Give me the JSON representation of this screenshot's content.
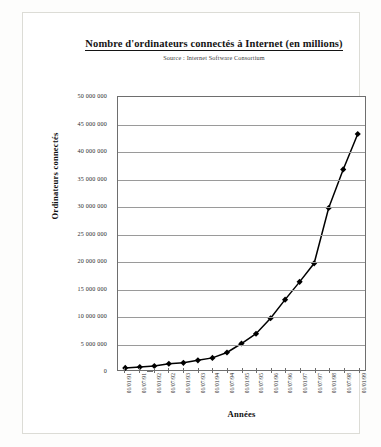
{
  "chart_title": "Nombre d'ordinateurs connectés à Internet (en millions)",
  "chart_subtitle": "Source : Internet Software Consortium",
  "axis": {
    "y_title": "Ordinateurs connectés",
    "x_title": "Années"
  },
  "chart_data": {
    "type": "line",
    "title": "Nombre d'ordinateurs connectés à Internet (en millions)",
    "subtitle": "Source : Internet Software Consortium",
    "xlabel": "Années",
    "ylabel": "Ordinateurs connectés",
    "ylim": [
      0,
      50000000
    ],
    "ytick_step": 5000000,
    "grid": true,
    "legend": false,
    "marker": "diamond",
    "marker_color": "#000000",
    "line_color": "#000000",
    "categories": [
      "01/01/91",
      "01/07/91",
      "01/01/92",
      "01/07/92",
      "01/01/93",
      "01/07/93",
      "01/01/94",
      "01/07/94",
      "01/01/95",
      "01/07/95",
      "01/01/96",
      "01/07/96",
      "01/01/97",
      "01/07/97",
      "01/01/98",
      "01/07/98",
      "01/01/99"
    ],
    "values": [
      376000,
      535000,
      727000,
      1136000,
      1313000,
      1776000,
      2217000,
      3212000,
      4852000,
      6642000,
      9472000,
      12881000,
      16146000,
      19540000,
      29670000,
      36739000,
      43230000
    ],
    "ytick_labels": [
      "50 000 000",
      "45 000 000",
      "40 000 000",
      "35 000 000",
      "30 000 000",
      "25 000 000",
      "20 000 000",
      "15 000 000",
      "10 000 000",
      "5 000 000",
      "0"
    ],
    "ytick_values": [
      50000000,
      45000000,
      40000000,
      35000000,
      30000000,
      25000000,
      20000000,
      15000000,
      10000000,
      5000000,
      0
    ]
  }
}
